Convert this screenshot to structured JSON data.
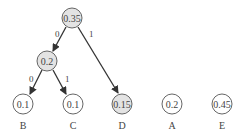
{
  "diagram": {
    "type": "huffman-tree",
    "colors": {
      "internal_fill": "#e3e3e3",
      "leaf_fill": "#ffffff",
      "stroke": "#555555",
      "edge": "#333333"
    },
    "nodes": {
      "root": {
        "value": "0.35",
        "shaded": true
      },
      "n02": {
        "value": "0.2",
        "shaded": true
      },
      "B": {
        "value": "0.1",
        "label": "B",
        "shaded": false
      },
      "C": {
        "value": "0.1",
        "label": "C",
        "shaded": false
      },
      "D": {
        "value": "0.15",
        "label": "D",
        "shaded": true
      },
      "A": {
        "value": "0.2",
        "label": "A",
        "shaded": false
      },
      "E": {
        "value": "0.45",
        "label": "E",
        "shaded": false
      }
    },
    "edges": [
      {
        "from": "root",
        "to": "n02",
        "label": "0"
      },
      {
        "from": "root",
        "to": "D",
        "label": "1"
      },
      {
        "from": "n02",
        "to": "B",
        "label": "0"
      },
      {
        "from": "n02",
        "to": "C",
        "label": "1"
      }
    ]
  }
}
